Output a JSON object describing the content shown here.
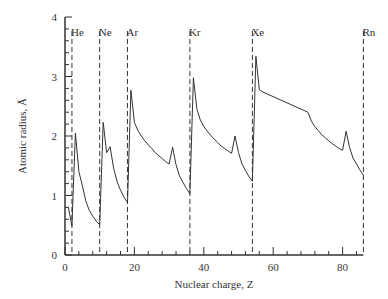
{
  "chart_data": {
    "type": "line",
    "title": "",
    "xlabel": "Nuclear charge, Z",
    "ylabel": "Atomic radius, Å",
    "xlim": [
      0,
      86
    ],
    "ylim": [
      0,
      4
    ],
    "xticks": [
      0,
      20,
      40,
      60,
      80
    ],
    "xtick_labels": [
      "0",
      "20",
      "40",
      "60",
      "80"
    ],
    "yticks": [
      0,
      1,
      2,
      3,
      4
    ],
    "ytick_labels": [
      "0",
      "1",
      "2",
      "3",
      "4"
    ],
    "grid": false,
    "legend": null,
    "annotations": {
      "noble_gas_lines": [
        {
          "label": "He",
          "z": 2
        },
        {
          "label": "Ne",
          "z": 10
        },
        {
          "label": "Ar",
          "z": 18
        },
        {
          "label": "Kr",
          "z": 36
        },
        {
          "label": "Xe",
          "z": 54
        },
        {
          "label": "Rn",
          "z": 86
        }
      ]
    },
    "series": [
      {
        "name": "Atomic radius",
        "x": [
          1,
          2,
          3,
          4,
          5,
          6,
          7,
          8,
          9,
          10,
          11,
          12,
          13,
          14,
          15,
          16,
          17,
          18,
          19,
          20,
          21,
          22,
          23,
          24,
          25,
          26,
          27,
          28,
          29,
          30,
          31,
          32,
          33,
          34,
          35,
          36,
          37,
          38,
          39,
          40,
          41,
          42,
          43,
          44,
          45,
          46,
          47,
          48,
          49,
          50,
          51,
          52,
          53,
          54,
          55,
          56,
          57,
          70,
          71,
          72,
          73,
          74,
          75,
          76,
          77,
          78,
          79,
          80,
          81,
          82,
          83,
          84,
          85,
          86
        ],
        "values": [
          0.79,
          0.49,
          2.05,
          1.4,
          1.17,
          0.91,
          0.75,
          0.65,
          0.57,
          0.51,
          2.23,
          1.72,
          1.82,
          1.46,
          1.23,
          1.09,
          0.97,
          0.88,
          2.77,
          2.23,
          2.09,
          2.0,
          1.92,
          1.85,
          1.79,
          1.72,
          1.67,
          1.62,
          1.57,
          1.53,
          1.81,
          1.52,
          1.33,
          1.22,
          1.12,
          1.03,
          2.98,
          2.45,
          2.27,
          2.16,
          2.08,
          2.01,
          1.95,
          1.89,
          1.83,
          1.79,
          1.75,
          1.71,
          2.0,
          1.72,
          1.53,
          1.42,
          1.32,
          1.24,
          3.34,
          2.78,
          2.74,
          2.4,
          2.25,
          2.16,
          2.09,
          2.02,
          1.97,
          1.92,
          1.87,
          1.83,
          1.79,
          1.76,
          2.08,
          1.81,
          1.63,
          1.53,
          1.43,
          1.34
        ]
      }
    ]
  }
}
